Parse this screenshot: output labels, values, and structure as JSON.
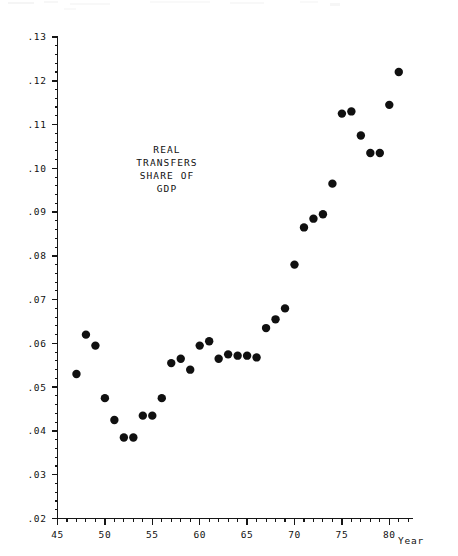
{
  "chart_data": {
    "type": "scatter",
    "title": "",
    "annotation": [
      "REAL",
      "TRANSFERS",
      "SHARE OF",
      "GDP"
    ],
    "xlabel": "Year",
    "ylabel": "",
    "xlim": [
      45,
      82.5
    ],
    "ylim": [
      0.02,
      0.13
    ],
    "grid": false,
    "legend": null,
    "x_ticks": [
      45,
      50,
      55,
      60,
      65,
      70,
      75,
      80
    ],
    "x_tick_labels": [
      "45",
      "50",
      "55",
      "60",
      "65",
      "70",
      "75",
      "80"
    ],
    "x_minor_step": 1,
    "y_ticks": [
      0.02,
      0.03,
      0.04,
      0.05,
      0.06,
      0.07,
      0.08,
      0.09,
      0.1,
      0.11,
      0.12,
      0.13
    ],
    "y_tick_labels": [
      ".02",
      ".03",
      ".04",
      ".05",
      ".06",
      ".07",
      ".08",
      ".09",
      ".10",
      ".11",
      ".12",
      ".13"
    ],
    "y_minor_step": 0.002,
    "marker": "filled-circle",
    "marker_color": "#101010",
    "marker_size": 4.2,
    "x": [
      47,
      48,
      49,
      50,
      51,
      52,
      53,
      54,
      55,
      56,
      57,
      58,
      59,
      60,
      61,
      62,
      63,
      64,
      65,
      66,
      67,
      68,
      69,
      70,
      71,
      72,
      73,
      74,
      75,
      76,
      77,
      78,
      79,
      80,
      81
    ],
    "values": [
      0.053,
      0.062,
      0.0595,
      0.0475,
      0.0425,
      0.0385,
      0.0385,
      0.0435,
      0.0435,
      0.0475,
      0.0555,
      0.0565,
      0.054,
      0.0595,
      0.0605,
      0.0565,
      0.0575,
      0.0572,
      0.0572,
      0.0568,
      0.0635,
      0.0655,
      0.068,
      0.078,
      0.0865,
      0.0885,
      0.0895,
      0.0965,
      0.1125,
      0.113,
      0.1075,
      0.1035,
      0.1035,
      0.1145,
      0.122
    ]
  },
  "axes": {
    "x_axis_name": "Year"
  },
  "colors": {
    "marker": "#101010",
    "axis": "#161616",
    "text": "#111111",
    "background": "#ffffff"
  }
}
